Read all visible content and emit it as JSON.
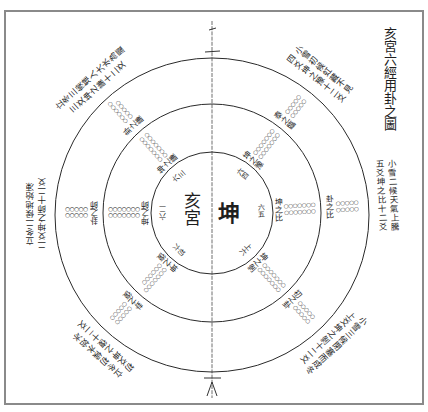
{
  "diagram": {
    "title": "亥宮六經用卦之圖",
    "center": {
      "palace": "亥宮",
      "hexagram": "坤"
    },
    "spokes": [
      {
        "position": "right",
        "inner_label": "六五",
        "mid_label": "坤之比",
        "mid_dots": [
          "○○○○○○○",
          "○○○○○○○"
        ],
        "outer_label": "卦之比",
        "outer_dots": [
          "○○○○○",
          "○○○○○"
        ],
        "annotation": [
          "小雪二候天氣上騰",
          "五爻坤之比十二爻"
        ]
      },
      {
        "position": "upper-right",
        "inner_label": "六四",
        "mid_label": "坤之豫",
        "mid_dots": [
          "○○○○○○○",
          "○○○○○○○"
        ],
        "outer_label": "泰之臨",
        "outer_dots": [
          "○○○○○",
          "○○○○○"
        ],
        "annotation": [
          "小雪初候虹藏不見",
          "四爻坤之豫十二爻"
        ]
      },
      {
        "position": "upper-left",
        "inner_label": "六三",
        "mid_label": "坤之謙",
        "mid_dots": [
          "○○○○○○○",
          "○○○○○○○"
        ],
        "outer_label": "卦之謙",
        "outer_dots": [
          "○○○○○○",
          "○○○○○"
        ],
        "annotation": [
          "立冬三候雉入大水為蜃",
          "三爻坤之謙十二爻"
        ]
      },
      {
        "position": "left",
        "inner_label": "六二",
        "mid_label": "坤之師",
        "mid_dots": [
          "○○○○○○○",
          "○○○○○○○"
        ],
        "outer_label": "卦之師",
        "outer_dots": [
          "○○○○○",
          "○○○○○"
        ],
        "annotation": [
          "立冬二候地始凍",
          "二爻坤之師十二爻"
        ]
      },
      {
        "position": "lower-left",
        "inner_label": "初六",
        "mid_label": "坤之復",
        "mid_dots": [
          "○○○○○○○",
          "○○○○○○"
        ],
        "outer_label": "卦之復",
        "outer_dots": [
          "○○○○○",
          "○○○○○"
        ],
        "annotation": [
          "立冬初候水始冰",
          "初爻坤之復十二爻"
        ]
      },
      {
        "position": "lower-right",
        "inner_label": "上六",
        "mid_label": "坤之剝",
        "mid_dots": [
          "○○○○○○○",
          "○○○○○○○"
        ],
        "outer_label": "初之卦",
        "outer_dots": [
          "○○○○○",
          "○○○○○"
        ],
        "annotation": [
          "小雪三候閉塞而成冬",
          "上爻坤之剝十二爻"
        ]
      }
    ]
  },
  "colors": {
    "ink": "#1e1e1e",
    "paper": "#ffffff",
    "frame": "#8a8a8a"
  }
}
